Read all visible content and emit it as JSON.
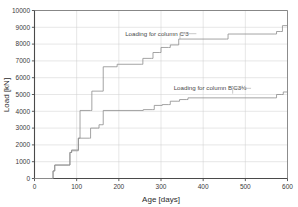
{
  "chart_data": {
    "type": "line",
    "title": "",
    "xlabel": "Age [days]",
    "ylabel": "Load [kN]",
    "xlim": [
      0,
      600
    ],
    "ylim": [
      0,
      10000
    ],
    "xticks": [
      0,
      100,
      200,
      300,
      400,
      500,
      600
    ],
    "xtick_labels": [
      "0",
      "100",
      "200",
      "300",
      "400",
      "500",
      "600"
    ],
    "yticks": [
      0,
      1000,
      2000,
      3000,
      4000,
      5000,
      6000,
      7000,
      8000,
      9000,
      10000
    ],
    "ytick_labels": [
      "0",
      "1000",
      "2000",
      "3000",
      "4000",
      "5000",
      "6000",
      "7000",
      "8000",
      "9000",
      "10000"
    ],
    "grid": true,
    "legend": "none",
    "drawstyle": "steps-post",
    "annotations": [
      {
        "name": "annotation-column-c3",
        "text": "Loading for column C'3",
        "x": 215,
        "y": 8500,
        "leader_to_x": 345,
        "leader_to_y": 8300
      },
      {
        "name": "annotation-column-bc3",
        "text": "Loading for column B'C3½",
        "x": 330,
        "y": 5250,
        "leader_to_x": 470,
        "leader_to_y": 5050
      }
    ],
    "series": [
      {
        "name": "Loading for column C'3",
        "color": "#8d8d8d",
        "points": [
          [
            0,
            0
          ],
          [
            40,
            0
          ],
          [
            44,
            450
          ],
          [
            48,
            800
          ],
          [
            80,
            800
          ],
          [
            84,
            1550
          ],
          [
            88,
            1700
          ],
          [
            100,
            1700
          ],
          [
            104,
            2400
          ],
          [
            108,
            4050
          ],
          [
            133,
            4050
          ],
          [
            136,
            5200
          ],
          [
            160,
            5200
          ],
          [
            163,
            6650
          ],
          [
            193,
            6650
          ],
          [
            196,
            6800
          ],
          [
            253,
            6800
          ],
          [
            257,
            7150
          ],
          [
            277,
            7150
          ],
          [
            281,
            7500
          ],
          [
            296,
            7500
          ],
          [
            300,
            7800
          ],
          [
            318,
            7800
          ],
          [
            322,
            7950
          ],
          [
            338,
            7950
          ],
          [
            342,
            8300
          ],
          [
            455,
            8300
          ],
          [
            459,
            8600
          ],
          [
            570,
            8600
          ],
          [
            574,
            8750
          ],
          [
            584,
            8750
          ],
          [
            588,
            9100
          ],
          [
            600,
            9100
          ]
        ]
      },
      {
        "name": "Loading for column B'C3½",
        "color": "#8d8d8d",
        "points": [
          [
            0,
            0
          ],
          [
            40,
            0
          ],
          [
            44,
            450
          ],
          [
            48,
            800
          ],
          [
            80,
            800
          ],
          [
            84,
            1550
          ],
          [
            88,
            1650
          ],
          [
            100,
            1650
          ],
          [
            104,
            2400
          ],
          [
            130,
            2400
          ],
          [
            133,
            3000
          ],
          [
            150,
            3000
          ],
          [
            153,
            3200
          ],
          [
            160,
            3200
          ],
          [
            163,
            4050
          ],
          [
            255,
            4050
          ],
          [
            258,
            4100
          ],
          [
            280,
            4100
          ],
          [
            284,
            4350
          ],
          [
            300,
            4350
          ],
          [
            303,
            4400
          ],
          [
            318,
            4400
          ],
          [
            322,
            4600
          ],
          [
            340,
            4600
          ],
          [
            344,
            4700
          ],
          [
            360,
            4700
          ],
          [
            364,
            4800
          ],
          [
            570,
            4800
          ],
          [
            574,
            5000
          ],
          [
            586,
            5000
          ],
          [
            590,
            5150
          ],
          [
            600,
            5150
          ]
        ]
      }
    ]
  }
}
